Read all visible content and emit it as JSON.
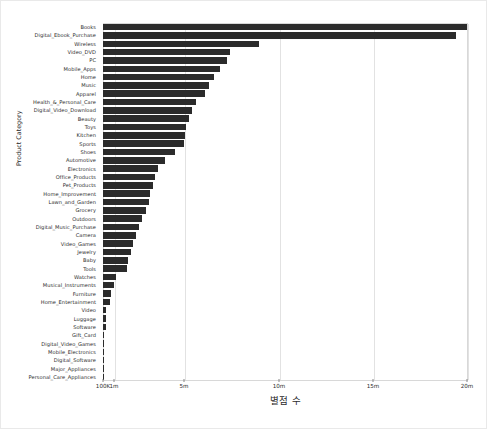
{
  "chart_data": {
    "type": "bar",
    "orientation": "horizontal",
    "title": "",
    "xlabel": "별점 수",
    "ylabel": "Product Category",
    "grid": true,
    "legend": null,
    "xlim": [
      100000,
      20000000
    ],
    "x_scale": "symlog",
    "x_ticks": [
      {
        "label": "100K",
        "value": 100000,
        "pos": 0.0
      },
      {
        "label": "1m",
        "value": 1000000,
        "pos": 0.0301
      },
      {
        "label": "5m",
        "value": 5000000,
        "pos": 0.2219
      },
      {
        "label": "10m",
        "value": 10000000,
        "pos": 0.4822
      },
      {
        "label": "15m",
        "value": 15000000,
        "pos": 0.7397
      },
      {
        "label": "20m",
        "value": 20000000,
        "pos": 0.9973
      }
    ],
    "categories": [
      "Books",
      "Digital_Ebook_Purchase",
      "Wireless",
      "Video_DVD",
      "PC",
      "Mobile_Apps",
      "Home",
      "Music",
      "Apparel",
      "Health_&_Personal_Care",
      "Digital_Video_Download",
      "Beauty",
      "Toys",
      "Kitchen",
      "Sports",
      "Shoes",
      "Automotive",
      "Electronics",
      "Office_Products",
      "Pet_Products",
      "Home_Improvement",
      "Lawn_and_Garden",
      "Grocery",
      "Outdoors",
      "Digital_Music_Purchase",
      "Camera",
      "Video_Games",
      "Jewelry",
      "Baby",
      "Tools",
      "Watches",
      "Musical_Instruments",
      "Furniture",
      "Home_Entertainment",
      "Video",
      "Luggage",
      "Software",
      "Gift_Card",
      "Digital_Video_Games",
      "Mobile_Electronics",
      "Digital_Software",
      "Major_Appliances",
      "Personal_Care_Appliances"
    ],
    "values": [
      19950000,
      19350000,
      8600000,
      7100000,
      6950000,
      6550000,
      6250000,
      6000000,
      5800000,
      5350000,
      5100000,
      4950000,
      4800000,
      4750000,
      4700000,
      4250000,
      3700000,
      3350000,
      3200000,
      3100000,
      2950000,
      2850000,
      2700000,
      2500000,
      2350000,
      2200000,
      2050000,
      1950000,
      1800000,
      1750000,
      1150000,
      1000000,
      850000,
      800000,
      420000,
      400000,
      390000,
      200000,
      185000,
      175000,
      165000,
      155000,
      145000
    ],
    "bar_fracs": [
      0.9973,
      0.9671,
      0.4274,
      0.348,
      0.3402,
      0.3192,
      0.3034,
      0.2902,
      0.2797,
      0.2558,
      0.2426,
      0.2347,
      0.2268,
      0.2241,
      0.2215,
      0.1977,
      0.1687,
      0.1511,
      0.1432,
      0.1379,
      0.13,
      0.1247,
      0.1168,
      0.1063,
      0.0984,
      0.0905,
      0.0826,
      0.0773,
      0.0694,
      0.0668,
      0.0352,
      0.0301,
      0.023,
      0.0205,
      0.0092,
      0.0085,
      0.0082,
      0.003,
      0.0026,
      0.0023,
      0.002,
      0.0016,
      0.0013
    ],
    "bar_color": "#2b2b2b",
    "grid_color": "#e2e2e2",
    "frame_color": "#d8d8d8"
  }
}
